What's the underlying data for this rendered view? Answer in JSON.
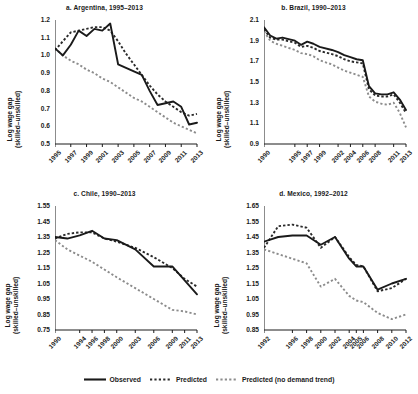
{
  "figure": {
    "ylabel_line1": "Log wage gap",
    "ylabel_line2": "(skilled–unskilled)"
  },
  "legend": {
    "position": "bottom-center",
    "items": [
      {
        "label": "Observed",
        "style": "solid",
        "color": "#1a1a1a"
      },
      {
        "label": "Predicted",
        "style": "dashed",
        "color": "#2b2b2b"
      },
      {
        "label": "Predicted (no demand trend)",
        "style": "dotted",
        "color": "#8c8c8c"
      }
    ]
  },
  "chart_data": [
    {
      "type": "line",
      "panel": "a",
      "title": "a. Argentina, 1995–2013",
      "xlabel": "",
      "ylabel": "Log wage gap (skilled–unskilled)",
      "ylim": [
        0.5,
        1.2
      ],
      "yticks": [
        "0.5",
        "0.6",
        "0.7",
        "0.8",
        "0.9",
        "1.0",
        "1.1",
        "1.2"
      ],
      "xlim": [
        1995,
        2013
      ],
      "xticks": [
        "1995",
        "1997",
        "1999",
        "2001",
        "2003",
        "2005",
        "2007",
        "2009",
        "2011",
        "2013"
      ],
      "grid": false,
      "x": [
        1995,
        1996,
        1997,
        1998,
        1999,
        2000,
        2001,
        2002,
        2003,
        2004,
        2005,
        2006,
        2007,
        2008,
        2009,
        2010,
        2011,
        2012,
        2013
      ],
      "series": [
        {
          "name": "Observed",
          "style": "solid",
          "values": [
            1.04,
            1.0,
            1.06,
            1.14,
            1.11,
            1.15,
            1.14,
            1.18,
            0.95,
            0.93,
            0.91,
            0.89,
            0.8,
            0.72,
            0.73,
            0.74,
            0.71,
            0.61,
            0.62
          ]
        },
        {
          "name": "Predicted",
          "style": "dashed",
          "values": [
            1.03,
            1.08,
            1.13,
            1.14,
            1.15,
            1.16,
            1.16,
            1.14,
            1.08,
            1.01,
            0.95,
            0.89,
            0.83,
            0.78,
            0.74,
            0.71,
            0.68,
            0.66,
            0.67
          ]
        },
        {
          "name": "Predicted (no demand trend)",
          "style": "dotted",
          "values": [
            1.04,
            1.0,
            0.97,
            0.95,
            0.92,
            0.9,
            0.87,
            0.85,
            0.82,
            0.79,
            0.76,
            0.74,
            0.71,
            0.68,
            0.65,
            0.62,
            0.6,
            0.58,
            0.56
          ]
        }
      ]
    },
    {
      "type": "line",
      "panel": "b",
      "title": "b. Brazil, 1990–2013",
      "xlabel": "",
      "ylabel": "Log wage gap (skilled–unskilled)",
      "ylim": [
        0.9,
        2.1
      ],
      "yticks": [
        "0.9",
        "1.1",
        "1.3",
        "1.5",
        "1.7",
        "1.9",
        "2.1"
      ],
      "xlim": [
        1990,
        2013
      ],
      "xticks": [
        "1990",
        "1995",
        "1997",
        "1999",
        "2002",
        "2004",
        "2006",
        "2008",
        "2011",
        "2013"
      ],
      "grid": false,
      "x": [
        1990,
        1991,
        1992,
        1993,
        1995,
        1996,
        1997,
        1998,
        1999,
        2001,
        2002,
        2003,
        2004,
        2005,
        2006,
        2007,
        2008,
        2009,
        2010,
        2011,
        2012,
        2013
      ],
      "series": [
        {
          "name": "Observed",
          "style": "solid",
          "values": [
            2.03,
            1.95,
            1.92,
            1.93,
            1.9,
            1.86,
            1.89,
            1.87,
            1.84,
            1.81,
            1.79,
            1.76,
            1.74,
            1.72,
            1.71,
            1.46,
            1.39,
            1.38,
            1.38,
            1.4,
            1.33,
            1.23
          ]
        },
        {
          "name": "Predicted",
          "style": "dashed",
          "values": [
            2.01,
            1.93,
            1.91,
            1.91,
            1.88,
            1.84,
            1.85,
            1.83,
            1.8,
            1.77,
            1.75,
            1.72,
            1.7,
            1.69,
            1.68,
            1.43,
            1.37,
            1.36,
            1.36,
            1.38,
            1.3,
            1.2
          ]
        },
        {
          "name": "Predicted (no demand trend)",
          "style": "dotted",
          "values": [
            1.99,
            1.9,
            1.87,
            1.85,
            1.81,
            1.78,
            1.77,
            1.75,
            1.71,
            1.67,
            1.64,
            1.61,
            1.59,
            1.57,
            1.55,
            1.36,
            1.31,
            1.29,
            1.28,
            1.3,
            1.2,
            1.06
          ]
        }
      ]
    },
    {
      "type": "line",
      "panel": "c",
      "title": "c. Chile, 1990–2013",
      "xlabel": "",
      "ylabel": "Log wage gap (skilled–unskilled)",
      "ylim": [
        0.75,
        1.55
      ],
      "yticks": [
        "0.75",
        "0.85",
        "0.95",
        "1.05",
        "1.15",
        "1.25",
        "1.35",
        "1.45",
        "1.55"
      ],
      "xlim": [
        1990,
        2013
      ],
      "xticks": [
        "1990",
        "1994",
        "1996",
        "1998",
        "2000",
        "2003",
        "2006",
        "2009",
        "2011",
        "2013"
      ],
      "grid": false,
      "x": [
        1990,
        1992,
        1994,
        1996,
        1998,
        2000,
        2003,
        2006,
        2009,
        2011,
        2013
      ],
      "series": [
        {
          "name": "Observed",
          "style": "solid",
          "values": [
            1.35,
            1.34,
            1.36,
            1.39,
            1.34,
            1.33,
            1.27,
            1.16,
            1.16,
            1.07,
            0.98
          ]
        },
        {
          "name": "Predicted",
          "style": "dashed",
          "values": [
            1.34,
            1.37,
            1.38,
            1.38,
            1.34,
            1.32,
            1.28,
            1.22,
            1.15,
            1.08,
            1.03
          ]
        },
        {
          "name": "Predicted (no demand trend)",
          "style": "dotted",
          "values": [
            1.33,
            1.27,
            1.23,
            1.19,
            1.14,
            1.09,
            1.02,
            0.95,
            0.88,
            0.87,
            0.85
          ]
        }
      ]
    },
    {
      "type": "line",
      "panel": "d",
      "title": "d. Mexico, 1992–2012",
      "xlabel": "",
      "ylabel": "Log wage gap (skilled–unskilled)",
      "ylim": [
        0.85,
        1.65
      ],
      "yticks": [
        "0.85",
        "0.95",
        "1.05",
        "1.15",
        "1.25",
        "1.35",
        "1.45",
        "1.55",
        "1.65"
      ],
      "xlim": [
        1992,
        2012
      ],
      "xticks": [
        "1992",
        "1996",
        "1998",
        "2000",
        "2002",
        "2004",
        "2005",
        "2006",
        "2008",
        "2010",
        "2012"
      ],
      "grid": false,
      "x": [
        1992,
        1994,
        1996,
        1998,
        2000,
        2002,
        2004,
        2005,
        2006,
        2008,
        2010,
        2012
      ],
      "series": [
        {
          "name": "Observed",
          "style": "solid",
          "values": [
            1.42,
            1.45,
            1.46,
            1.46,
            1.4,
            1.45,
            1.31,
            1.26,
            1.26,
            1.11,
            1.15,
            1.18
          ]
        },
        {
          "name": "Predicted",
          "style": "dashed",
          "values": [
            1.38,
            1.52,
            1.53,
            1.51,
            1.38,
            1.45,
            1.32,
            1.27,
            1.26,
            1.1,
            1.12,
            1.18
          ]
        },
        {
          "name": "Predicted (no demand trend)",
          "style": "dotted",
          "values": [
            1.37,
            1.34,
            1.31,
            1.28,
            1.13,
            1.18,
            1.07,
            1.04,
            1.03,
            0.96,
            0.92,
            0.95
          ]
        }
      ]
    }
  ]
}
